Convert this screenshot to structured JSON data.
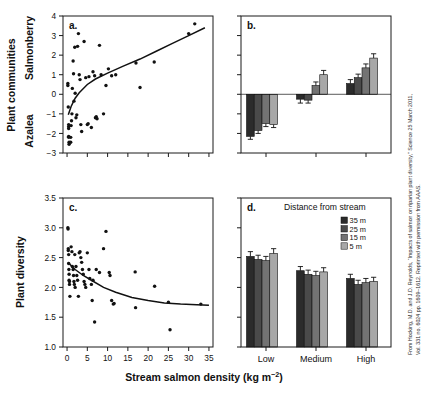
{
  "figure": {
    "xlabel": "Stream salmon density (kg m",
    "xlabel_exponent": "−2",
    "xlabel_close": ")",
    "ylabel_left_top": "Plant communities",
    "ylabel_top_inner_high": "Salmonberry",
    "ylabel_top_inner_low": "Azalea",
    "ylabel_bottom": "Plant diversity",
    "attribution": "From Hocking, M.D. and J.D. Reynolds, “Impacts of salmon on riparian plant diversity,” Science 25 March 2011, Vol. 331 no. 6024 pp. 1609–1612. Reprinted with permission from AAAS.",
    "attribution_line1": "From Hocking, M.D. and J.D. Reynolds, “Impacts of salmon on riparian plant diversity,” Science 25 March 2011,",
    "attribution_line2": "Vol. 331 no. 6024 pp. 1609–1612. Reprinted with permission from AAAS."
  },
  "chart_data": [
    {
      "id": "panel-a",
      "panel_letter": "a.",
      "type": "scatter",
      "title": "",
      "xlabel": "Stream salmon density (kg m−2)",
      "ylabel": "Plant communities (Azalea ↔ Salmonberry)",
      "xlim": [
        -1,
        36
      ],
      "ylim": [
        -3,
        4
      ],
      "xticks": [
        0,
        5,
        10,
        15,
        20,
        25,
        30,
        35
      ],
      "xticklabels": [
        "",
        "",
        "",
        "",
        "",
        "",
        "",
        ""
      ],
      "yticks": [
        -3,
        -2,
        -1,
        0,
        1,
        2,
        3,
        4
      ],
      "yticklabels": [
        "−3",
        "−2",
        "−1",
        "0",
        "1",
        "2",
        "3",
        "4"
      ],
      "grid": false,
      "points": [
        [
          0.2,
          0.55
        ],
        [
          0.2,
          0.45
        ],
        [
          0.3,
          -0.65
        ],
        [
          0.4,
          -1.55
        ],
        [
          0.4,
          -1.65
        ],
        [
          0.4,
          -1.75
        ],
        [
          0.4,
          -2.15
        ],
        [
          0.4,
          -2.2
        ],
        [
          0.5,
          -2.45
        ],
        [
          0.5,
          -2.55
        ],
        [
          0.9,
          -2.45
        ],
        [
          0.9,
          -2.2
        ],
        [
          1.0,
          -1.6
        ],
        [
          1.1,
          -1.35
        ],
        [
          1.2,
          -1.0
        ],
        [
          1.3,
          0.3
        ],
        [
          1.5,
          1.7
        ],
        [
          1.6,
          1.05
        ],
        [
          1.7,
          -0.35
        ],
        [
          1.9,
          2.4
        ],
        [
          2.0,
          0.05
        ],
        [
          2.2,
          -1.2
        ],
        [
          2.4,
          -1.05
        ],
        [
          2.6,
          2.45
        ],
        [
          2.8,
          3.1
        ],
        [
          3.0,
          1.0
        ],
        [
          3.2,
          0.75
        ],
        [
          3.4,
          -1.55
        ],
        [
          3.6,
          -1.9
        ],
        [
          4.2,
          2.7
        ],
        [
          4.6,
          0.85
        ],
        [
          5.0,
          -1.55
        ],
        [
          5.2,
          -1.5
        ],
        [
          5.4,
          0.9
        ],
        [
          6.0,
          -1.7
        ],
        [
          6.4,
          1.15
        ],
        [
          6.8,
          0.95
        ],
        [
          7.0,
          -1.2
        ],
        [
          7.2,
          -1.15
        ],
        [
          7.4,
          -1.25
        ],
        [
          8.0,
          2.5
        ],
        [
          8.4,
          1.0
        ],
        [
          9.0,
          -1.0
        ],
        [
          9.6,
          0.45
        ],
        [
          10.2,
          1.3
        ],
        [
          11.0,
          0.95
        ],
        [
          12.0,
          1.0
        ],
        [
          17.0,
          1.6
        ],
        [
          18.0,
          0.35
        ],
        [
          21.5,
          1.65
        ],
        [
          30.0,
          3.1
        ],
        [
          31.5,
          3.6
        ]
      ],
      "fit_curve": {
        "description": "increasing saturating log-like regression line",
        "x": [
          0.3,
          1,
          2,
          3,
          5,
          7,
          10,
          14,
          18,
          22,
          26,
          30,
          34
        ],
        "y": [
          -1.05,
          -0.62,
          -0.2,
          0.08,
          0.5,
          0.78,
          1.08,
          1.45,
          1.8,
          2.2,
          2.6,
          3.0,
          3.4
        ]
      }
    },
    {
      "id": "panel-b",
      "panel_letter": "b.",
      "type": "bar",
      "title": "",
      "xlabel": "",
      "ylabel": "Plant communities (Azalea ↔ Salmonberry)",
      "ylim": [
        -3,
        4
      ],
      "yticks": [
        -3,
        -2,
        -1,
        0,
        1,
        2,
        3,
        4
      ],
      "yticklabels": [
        "",
        "",
        "",
        "",
        "",
        "",
        "",
        ""
      ],
      "grid": false,
      "categories": [
        "Low",
        "Medium",
        "High"
      ],
      "category_labels_shown": false,
      "series": [
        {
          "name": "35 m",
          "color": "#2b2b2b",
          "values": [
            -2.15,
            -0.25,
            0.55
          ],
          "errors": [
            0.15,
            0.2,
            0.2
          ]
        },
        {
          "name": "25 m",
          "color": "#4a4a4a",
          "values": [
            -1.85,
            -0.3,
            0.85
          ],
          "errors": [
            0.15,
            0.15,
            0.18
          ]
        },
        {
          "name": "15 m",
          "color": "#737373",
          "values": [
            -1.5,
            0.45,
            1.35
          ],
          "errors": [
            0.15,
            0.18,
            0.2
          ]
        },
        {
          "name": "5 m",
          "color": "#a8a8a8",
          "values": [
            -1.55,
            1.0,
            1.85
          ],
          "errors": [
            0.15,
            0.22,
            0.22
          ]
        }
      ]
    },
    {
      "id": "panel-c",
      "panel_letter": "c.",
      "type": "scatter",
      "title": "",
      "xlabel": "Stream salmon density (kg m−2)",
      "ylabel": "Plant diversity",
      "xlim": [
        -1,
        36
      ],
      "ylim": [
        1.0,
        3.5
      ],
      "xticks": [
        0,
        5,
        10,
        15,
        20,
        25,
        30,
        35
      ],
      "xticklabels": [
        "0",
        "5",
        "10",
        "15",
        "20",
        "25",
        "30",
        "35"
      ],
      "yticks": [
        1.0,
        1.5,
        2.0,
        2.5,
        3.0,
        3.5
      ],
      "yticklabels": [
        "1.0",
        "1.5",
        "2.0",
        "2.5",
        "3.0",
        "3.5"
      ],
      "grid": false,
      "points": [
        [
          0.2,
          3.0
        ],
        [
          0.25,
          2.98
        ],
        [
          0.3,
          2.65
        ],
        [
          0.3,
          2.62
        ],
        [
          0.4,
          2.55
        ],
        [
          0.4,
          2.4
        ],
        [
          0.45,
          2.3
        ],
        [
          0.5,
          2.22
        ],
        [
          0.5,
          2.12
        ],
        [
          0.6,
          2.1
        ],
        [
          0.6,
          2.05
        ],
        [
          0.7,
          1.85
        ],
        [
          1.0,
          2.68
        ],
        [
          1.2,
          2.6
        ],
        [
          1.3,
          2.35
        ],
        [
          1.5,
          2.3
        ],
        [
          1.6,
          2.2
        ],
        [
          1.7,
          2.1
        ],
        [
          1.8,
          2.05
        ],
        [
          1.9,
          2.55
        ],
        [
          2.0,
          2.0
        ],
        [
          2.2,
          2.35
        ],
        [
          2.4,
          2.2
        ],
        [
          2.6,
          2.12
        ],
        [
          2.8,
          1.85
        ],
        [
          3.0,
          2.58
        ],
        [
          3.2,
          2.6
        ],
        [
          3.4,
          2.5
        ],
        [
          3.6,
          2.42
        ],
        [
          3.8,
          2.3
        ],
        [
          4.0,
          2.22
        ],
        [
          4.2,
          2.1
        ],
        [
          4.4,
          2.05
        ],
        [
          4.6,
          2.0
        ],
        [
          5.0,
          2.58
        ],
        [
          5.4,
          2.3
        ],
        [
          5.6,
          2.15
        ],
        [
          6.0,
          2.05
        ],
        [
          6.2,
          1.78
        ],
        [
          6.4,
          2.12
        ],
        [
          6.8,
          1.42
        ],
        [
          7.2,
          2.3
        ],
        [
          8.0,
          2.25
        ],
        [
          9.0,
          2.65
        ],
        [
          9.6,
          2.94
        ],
        [
          10.4,
          2.25
        ],
        [
          10.6,
          2.2
        ],
        [
          11.0,
          1.78
        ],
        [
          11.4,
          1.72
        ],
        [
          11.6,
          1.73
        ],
        [
          16.8,
          2.26
        ],
        [
          16.9,
          1.66
        ],
        [
          21.6,
          2.02
        ],
        [
          25.0,
          1.75
        ],
        [
          25.4,
          1.29
        ],
        [
          33.0,
          1.72
        ]
      ],
      "fit_curve": {
        "description": "decreasing saturating regression line",
        "x": [
          0.2,
          2,
          4,
          6,
          9,
          12,
          16,
          20,
          24,
          28,
          32,
          35
        ],
        "y": [
          2.42,
          2.3,
          2.2,
          2.12,
          2.0,
          1.92,
          1.83,
          1.78,
          1.74,
          1.72,
          1.71,
          1.7
        ]
      }
    },
    {
      "id": "panel-d",
      "panel_letter": "d.",
      "type": "bar",
      "title": "",
      "xlabel": "",
      "ylabel": "Plant diversity",
      "ylim": [
        1.0,
        3.5
      ],
      "yticks": [
        1.0,
        1.5,
        2.0,
        2.5,
        3.0,
        3.5
      ],
      "yticklabels": [
        "",
        "",
        "",
        "",
        "",
        ""
      ],
      "grid": false,
      "categories": [
        "Low",
        "Medium",
        "High"
      ],
      "category_labels_shown": true,
      "legend_title": "Distance from stream",
      "legend_position": "top-right-inside",
      "series": [
        {
          "name": "35 m",
          "color": "#2b2b2b",
          "values": [
            2.52,
            2.28,
            2.15
          ],
          "errors": [
            0.08,
            0.07,
            0.07
          ]
        },
        {
          "name": "25 m",
          "color": "#4a4a4a",
          "values": [
            2.47,
            2.22,
            2.05
          ],
          "errors": [
            0.07,
            0.07,
            0.07
          ]
        },
        {
          "name": "15 m",
          "color": "#737373",
          "values": [
            2.45,
            2.2,
            2.08
          ],
          "errors": [
            0.07,
            0.07,
            0.07
          ]
        },
        {
          "name": "5 m",
          "color": "#a8a8a8",
          "values": [
            2.57,
            2.26,
            2.1
          ],
          "errors": [
            0.08,
            0.07,
            0.07
          ]
        }
      ]
    }
  ],
  "legend": {
    "title": "Distance from stream",
    "items": [
      {
        "label": "35 m",
        "color": "#2b2b2b"
      },
      {
        "label": "25 m",
        "color": "#4a4a4a"
      },
      {
        "label": "15 m",
        "color": "#737373"
      },
      {
        "label": "5 m",
        "color": "#a8a8a8"
      }
    ]
  },
  "category_axis": {
    "labels": [
      "Low",
      "Medium",
      "High"
    ]
  },
  "colors": {
    "bar_35m": "#2b2b2b",
    "bar_25m": "#4a4a4a",
    "bar_15m": "#737373",
    "bar_5m": "#a8a8a8",
    "axis": "#1a1a1a",
    "text": "#111111",
    "background": "#ffffff"
  }
}
